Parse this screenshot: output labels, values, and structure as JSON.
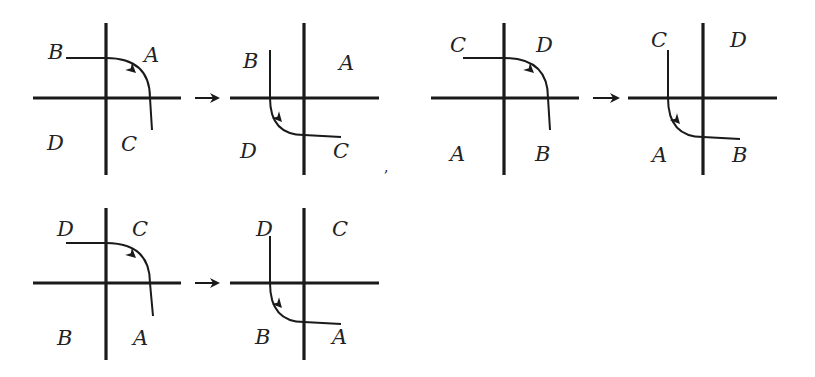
{
  "figure": {
    "colors": {
      "ink": "#1a1a1a",
      "background": "#ffffff"
    },
    "panels": [
      {
        "id": "p1",
        "cx": 106,
        "cy": 98,
        "x1": 33,
        "x2": 181,
        "y1": 23,
        "y2": 175,
        "labels": {
          "top_left": "B",
          "top_right": "A",
          "bottom_left": "D",
          "bottom_right": "C"
        },
        "label_pos": {
          "top_left": [
            48,
            59
          ],
          "top_right": [
            144,
            62
          ],
          "bottom_left": [
            47,
            150
          ],
          "bottom_right": [
            121,
            151
          ]
        },
        "curve": "M 66 58 L 106 58 Q 150 58 150 98 L 152 130",
        "arrow": {
          "x": 136,
          "y": 73,
          "angle": 42
        }
      },
      {
        "id": "p2",
        "cx": 304,
        "cy": 98,
        "x1": 230,
        "x2": 379,
        "y1": 23,
        "y2": 175,
        "labels": {
          "top_left": "B",
          "top_right": "A",
          "bottom_left": "D",
          "bottom_right": "C"
        },
        "label_pos": {
          "top_left": [
            243,
            68
          ],
          "top_right": [
            339,
            70
          ],
          "bottom_left": [
            240,
            158
          ],
          "bottom_right": [
            333,
            158
          ]
        },
        "curve": "M 270 50 L 270 98 Q 270 135 304 135 L 341 137",
        "arrow": {
          "x": 282,
          "y": 122,
          "angle": 48
        }
      },
      {
        "id": "p3",
        "cx": 504,
        "cy": 98,
        "x1": 431,
        "x2": 579,
        "y1": 23,
        "y2": 175,
        "labels": {
          "top_left": "C",
          "top_right": "D",
          "bottom_left": "A",
          "bottom_right": "B"
        },
        "label_pos": {
          "top_left": [
            450,
            52
          ],
          "top_right": [
            536,
            52
          ],
          "bottom_left": [
            450,
            161
          ],
          "bottom_right": [
            535,
            161
          ]
        },
        "curve": "M 463 58 L 504 58 Q 548 58 548 98 L 550 130",
        "arrow": {
          "x": 534,
          "y": 73,
          "angle": 42
        }
      },
      {
        "id": "p4",
        "cx": 703,
        "cy": 98,
        "x1": 628,
        "x2": 777,
        "y1": 23,
        "y2": 175,
        "labels": {
          "top_left": "C",
          "top_right": "D",
          "bottom_left": "A",
          "bottom_right": "B"
        },
        "label_pos": {
          "top_left": [
            651,
            47
          ],
          "top_right": [
            730,
            47
          ],
          "bottom_left": [
            652,
            162
          ],
          "bottom_right": [
            732,
            162
          ]
        },
        "curve": "M 668 50 L 668 98 Q 668 137 703 137 L 740 139",
        "arrow": {
          "x": 680,
          "y": 124,
          "angle": 48
        }
      },
      {
        "id": "p5",
        "cx": 106,
        "cy": 283,
        "x1": 33,
        "x2": 181,
        "y1": 208,
        "y2": 360,
        "labels": {
          "top_left": "D",
          "top_right": "C",
          "bottom_left": "B",
          "bottom_right": "A"
        },
        "label_pos": {
          "top_left": [
            57,
            236
          ],
          "top_right": [
            132,
            236
          ],
          "bottom_left": [
            57,
            345
          ],
          "bottom_right": [
            133,
            345
          ]
        },
        "curve": "M 66 243 L 106 243 Q 150 243 150 283 L 153 316",
        "arrow": {
          "x": 136,
          "y": 258,
          "angle": 42
        }
      },
      {
        "id": "p6",
        "cx": 304,
        "cy": 283,
        "x1": 230,
        "x2": 379,
        "y1": 208,
        "y2": 360,
        "labels": {
          "top_left": "D",
          "top_right": "C",
          "bottom_left": "B",
          "bottom_right": "A"
        },
        "label_pos": {
          "top_left": [
            256,
            236
          ],
          "top_right": [
            332,
            236
          ],
          "bottom_left": [
            255,
            344
          ],
          "bottom_right": [
            332,
            344
          ]
        },
        "curve": "M 270 236 L 270 283 Q 270 322 304 322 L 341 324",
        "arrow": {
          "x": 282,
          "y": 308,
          "angle": 48
        }
      }
    ],
    "transitions": [
      {
        "from": "p1",
        "to": "p2",
        "x1": 195,
        "x2": 220,
        "y": 98
      },
      {
        "from": "p3",
        "to": "p4",
        "x1": 593,
        "x2": 620,
        "y": 98
      },
      {
        "from": "p5",
        "to": "p6",
        "x1": 195,
        "x2": 220,
        "y": 283
      }
    ],
    "stray_mark": {
      "text": ",",
      "x": 384,
      "y": 172
    }
  }
}
